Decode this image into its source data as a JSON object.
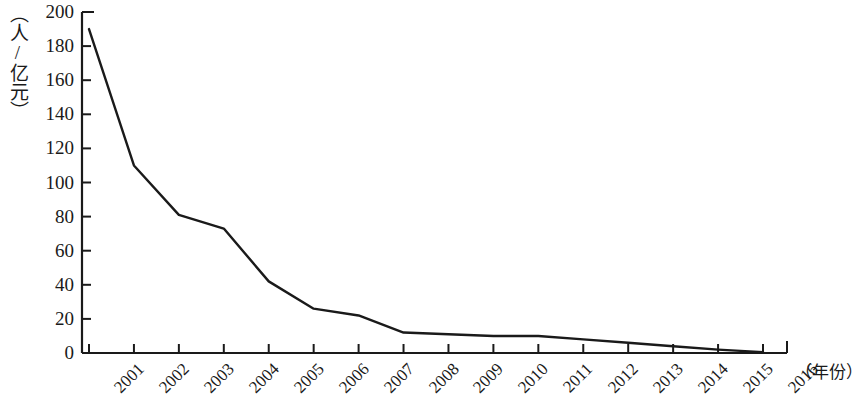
{
  "chart_data": {
    "type": "line",
    "title": "",
    "subtitle": "",
    "xlabel": "（年份）",
    "ylabel": "（人/亿元）",
    "categories": [
      "2001",
      "2002",
      "2003",
      "2004",
      "2005",
      "2006",
      "2007",
      "2008",
      "2009",
      "2010",
      "2011",
      "2012",
      "2013",
      "2014",
      "2015",
      "2016"
    ],
    "values": [
      190,
      110,
      81,
      73,
      42,
      26,
      22,
      12,
      11,
      10,
      10,
      8,
      6,
      4,
      2,
      0.5
    ],
    "series": [
      {
        "name": "",
        "values": [
          190,
          110,
          81,
          73,
          42,
          26,
          22,
          12,
          11,
          10,
          10,
          8,
          6,
          4,
          2,
          0.5
        ]
      }
    ],
    "x": [
      "2001",
      "2002",
      "2003",
      "2004",
      "2005",
      "2006",
      "2007",
      "2008",
      "2009",
      "2010",
      "2011",
      "2012",
      "2013",
      "2014",
      "2015",
      "2016"
    ],
    "ylim": [
      0,
      200
    ],
    "ytick_labels": [
      "0",
      "20",
      "40",
      "60",
      "80",
      "100",
      "120",
      "140",
      "160",
      "180",
      "200"
    ],
    "ytick_values": [
      0,
      20,
      40,
      60,
      80,
      100,
      120,
      140,
      160,
      180,
      200
    ],
    "xtick_labels": [
      "2001",
      "2002",
      "2003",
      "2004",
      "2005",
      "2006",
      "2007",
      "2008",
      "2009",
      "2010",
      "2011",
      "2012",
      "2013",
      "2014",
      "2015",
      "2016"
    ],
    "grid": false,
    "legend": false,
    "legend_position": "none",
    "line_color": "#1a1a1a",
    "axis_color": "#1a1a1a",
    "background_color": "#ffffff",
    "markers": false,
    "annotations": []
  }
}
